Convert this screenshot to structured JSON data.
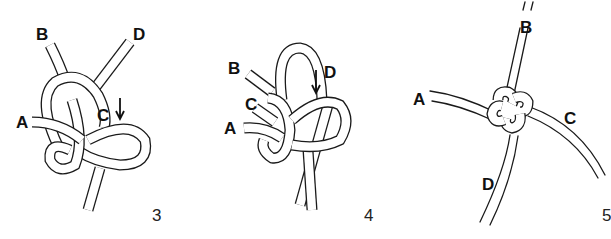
{
  "diagram": {
    "type": "knot-tying instructions",
    "colors": {
      "line": "#1a1a1a",
      "background": "#ffffff"
    },
    "steps": [
      {
        "number": "3",
        "labels": {
          "A": "A",
          "B": "B",
          "C": "C",
          "D": "D"
        },
        "arrow": "down-arrow near C"
      },
      {
        "number": "4",
        "labels": {
          "A": "A",
          "B": "B",
          "C": "C",
          "D": "D"
        },
        "arrow": "down-arrow near D"
      },
      {
        "number": "5",
        "labels": {
          "A": "A",
          "B": "B",
          "C": "C",
          "D": "D"
        }
      }
    ]
  }
}
